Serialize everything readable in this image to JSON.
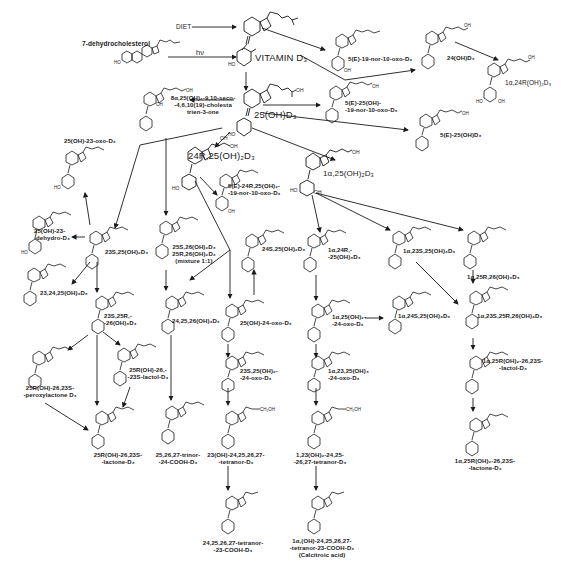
{
  "diagram": {
    "type": "metabolic-pathway",
    "sources": [
      {
        "id": "diet",
        "label": "DIET"
      },
      {
        "id": "7dhc",
        "label": "7-dehydrocholesterol"
      },
      {
        "id": "light",
        "label": "hν"
      }
    ],
    "compounds": [
      {
        "id": "vitd3",
        "label": "VITAMIN D₃"
      },
      {
        "id": "oh25",
        "label": "25(OH)D₃"
      },
      {
        "id": "ak25",
        "label": "8α,25(OH)₂-9,10-seco-\n-4,6,10(19)-cholesta\ntrien-3-one"
      },
      {
        "id": "e19nor",
        "label": "5(E)-19-nor-10-oxo-D₃"
      },
      {
        "id": "e25oh19nor",
        "label": "5(E)-25(OH)-\n-19-nor-10-oxo-D₃"
      },
      {
        "id": "oh24",
        "label": "24(OH)D₃"
      },
      {
        "id": "a24r",
        "label": "1α,24R(OH)₂D₃"
      },
      {
        "id": "e25oh",
        "label": "5(E)-25(OH)D₃"
      },
      {
        "id": "r2425",
        "label": "24R,25(OH)₂D₃"
      },
      {
        "id": "e24r",
        "label": "5(E)-24R,25(OH)₂-\n-19-nor-10-oxo-D₃"
      },
      {
        "id": "a125",
        "label": "1α,25(OH)₂D₃"
      },
      {
        "id": "oxo23",
        "label": "25(OH)-23-oxo-D₃"
      },
      {
        "id": "dehydro23",
        "label": "25(OH)-23-\n-dehydro-D₃"
      },
      {
        "id": "s2325",
        "label": "23S,25(OH)₂D₃"
      },
      {
        "id": "mix2526",
        "label": "25S,26(OH)₂D₃\n25R,26(OH)₂D₃\n(mixture 1:1)"
      },
      {
        "id": "s2425",
        "label": "24S,25(OH)₂D₃"
      },
      {
        "id": "a24r25",
        "label": "1α,24R,-\n-25(OH)₃D₃"
      },
      {
        "id": "a23s25",
        "label": "1α,23S,25(OH)₃D₃"
      },
      {
        "id": "a25r26",
        "label": "1α,25R,26(OH)₃D₃"
      },
      {
        "id": "t232425",
        "label": "23,24,25(OH)₃D₃"
      },
      {
        "id": "s23r25_26",
        "label": "23S,25R,-\n-26(OH)₃D₃"
      },
      {
        "id": "t242526",
        "label": "24,25,26(OH)₃D₃"
      },
      {
        "id": "oxo24",
        "label": "25(OH)-24-oxo-D₃"
      },
      {
        "id": "a125oxo24",
        "label": "1α,25(OH)₂-\n-24-oxo-D₃"
      },
      {
        "id": "a24s25",
        "label": "1α,24S,25(OH)₃D₃"
      },
      {
        "id": "a23s25r26",
        "label": "1α,23S,25R,26(OH)₄D₃"
      },
      {
        "id": "perox",
        "label": "25R(OH)-26,23S-\n-peroxylactone D₃"
      },
      {
        "id": "lactol",
        "label": "25R(OH)-26,-\n-23S-lactol-D₃"
      },
      {
        "id": "s2325oxo24",
        "label": "23S,25(OH)₂-\n-24-oxo-D₃"
      },
      {
        "id": "a2325oxo24",
        "label": "1α,23,25(OH)₃\n-24-oxo-D₃"
      },
      {
        "id": "a25r_lactol",
        "label": "1α,25R(OH)₂-26,23S-\n-lactol-D₃"
      },
      {
        "id": "lactone",
        "label": "25R(OH)-26,23S-\n-lactone-D₃"
      },
      {
        "id": "trinor",
        "label": "25,26,27-trinor-\n-24-COOH-D₃"
      },
      {
        "id": "tetranor23",
        "label": "23(OH)-24,25,26,27-\n-tetranor-D₃"
      },
      {
        "id": "a1tetranor",
        "label": "1,23(OH)₂-24,25-\n-26,27-tetranor-D₃"
      },
      {
        "id": "a25r_lactone",
        "label": "1α,25R(OH)₂-26,23S-\n-lactone-D₃"
      },
      {
        "id": "tetranorCOOH",
        "label": "24,25,26,27-tetranor-\n-23-COOH-D₃"
      },
      {
        "id": "calcitroic",
        "label": "1α,(OH)-24,25,26,27-\n-tetranor-23-COOH-D₃\n(Calcitroic acid)"
      }
    ],
    "colors": {
      "ink": "#1a1a1a",
      "background": "#ffffff"
    }
  }
}
